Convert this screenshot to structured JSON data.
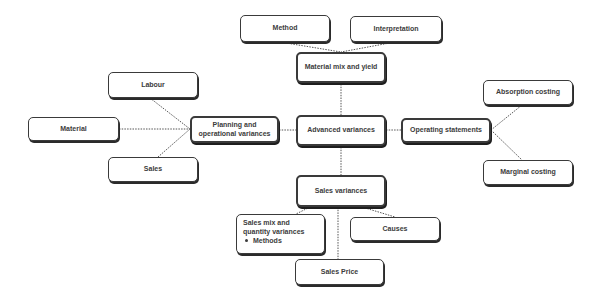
{
  "diagram": {
    "center": {
      "label": "Advanced variances"
    },
    "top": {
      "hub": {
        "label": "Material mix and yield"
      },
      "children": [
        {
          "label": "Method"
        },
        {
          "label": "Interpretation"
        }
      ]
    },
    "left": {
      "hub": {
        "label_line1": "Planning and",
        "label_line2": "operational variances"
      },
      "children": [
        {
          "label": "Labour"
        },
        {
          "label": "Material"
        },
        {
          "label": "Sales"
        }
      ]
    },
    "right": {
      "hub": {
        "label": "Operating statements"
      },
      "children": [
        {
          "label": "Absorption costing"
        },
        {
          "label": "Marginal costing"
        }
      ]
    },
    "bottom": {
      "hub": {
        "label": "Sales variances"
      },
      "children": [
        {
          "label_line1": "Sales mix and",
          "label_line2": "quantity variances",
          "bullet": "Methods"
        },
        {
          "label": "Causes"
        },
        {
          "label": "Sales Price"
        }
      ]
    }
  },
  "style": {
    "border_color": "#3a3a3a",
    "text_color": "#3c3c3c",
    "connector_color": "#555555"
  }
}
